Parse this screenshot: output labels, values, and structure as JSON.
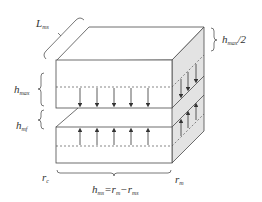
{
  "diagram": {
    "title": "",
    "colors": {
      "stroke": "#4a4a4a",
      "side_face": "#e3e3e3",
      "dashed": "#555555",
      "background": "#ffffff"
    },
    "labels": {
      "length": {
        "base": "L",
        "sub": "ms"
      },
      "top_gap": {
        "base": "h",
        "sub": "max"
      },
      "mid_gap": {
        "base": "h",
        "sub": "mf"
      },
      "half_height": {
        "base": "h",
        "sub": "max",
        "suffix": "/2"
      },
      "inner_radius": {
        "base": "r",
        "sub": "c"
      },
      "outer_radius": {
        "base": "r",
        "sub": "m"
      },
      "thickness": {
        "base": "h",
        "sub": "ms",
        "eq": "=",
        "a": "r",
        "a_sub": "m",
        "op": "−",
        "b": "r",
        "b_sub": "ms"
      }
    },
    "arrows": {
      "top_layer_direction": "down",
      "bottom_layer_direction": "up",
      "front_count": 5,
      "side_count": 3
    }
  }
}
